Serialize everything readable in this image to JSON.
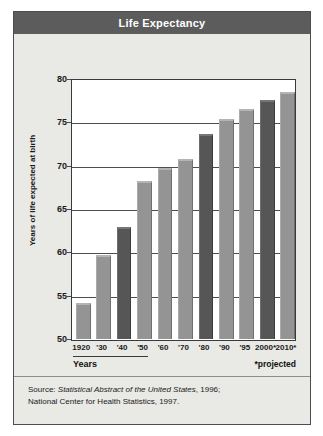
{
  "title": "Life Expectancy",
  "chart_data": {
    "type": "bar",
    "title": "Life Expectancy",
    "xlabel": "Years",
    "ylabel": "Years of life expected at birth",
    "categories": [
      "1920",
      "'30",
      "'40",
      "'50",
      "'60",
      "'70",
      "'80",
      "'90",
      "'95",
      "2000*",
      "2010*"
    ],
    "values": [
      54.1,
      59.7,
      62.9,
      68.2,
      69.7,
      70.8,
      73.7,
      75.4,
      76.5,
      77.6,
      78.5
    ],
    "ylim": [
      50,
      80
    ],
    "yticks": [
      50,
      55,
      60,
      65,
      70,
      75,
      80
    ],
    "ytick_labels": [
      "50",
      "55",
      "60",
      "65",
      "70",
      "75",
      "80"
    ],
    "grid": true,
    "legend": "none",
    "bar_styles": [
      "light",
      "light",
      "dark",
      "light",
      "light",
      "light",
      "dark",
      "light",
      "light",
      "dark",
      "light"
    ],
    "colors": {
      "bar_light": "#949494",
      "bar_dark": "#565656",
      "title_bar": "#5c5c5c",
      "panel_background": "#e9e9e6",
      "plot_background": "#ffffff",
      "axis": "#3a3a3a",
      "text": "#1a1a1a"
    },
    "annotations": [
      "*projected"
    ]
  },
  "footnote": "*projected",
  "source": {
    "line1_prefix": "Source: ",
    "line1_italic": "Statistical Abstract of the United States",
    "line1_suffix": ", 1996;",
    "line2": "National Center for Health Statistics, 1997."
  }
}
